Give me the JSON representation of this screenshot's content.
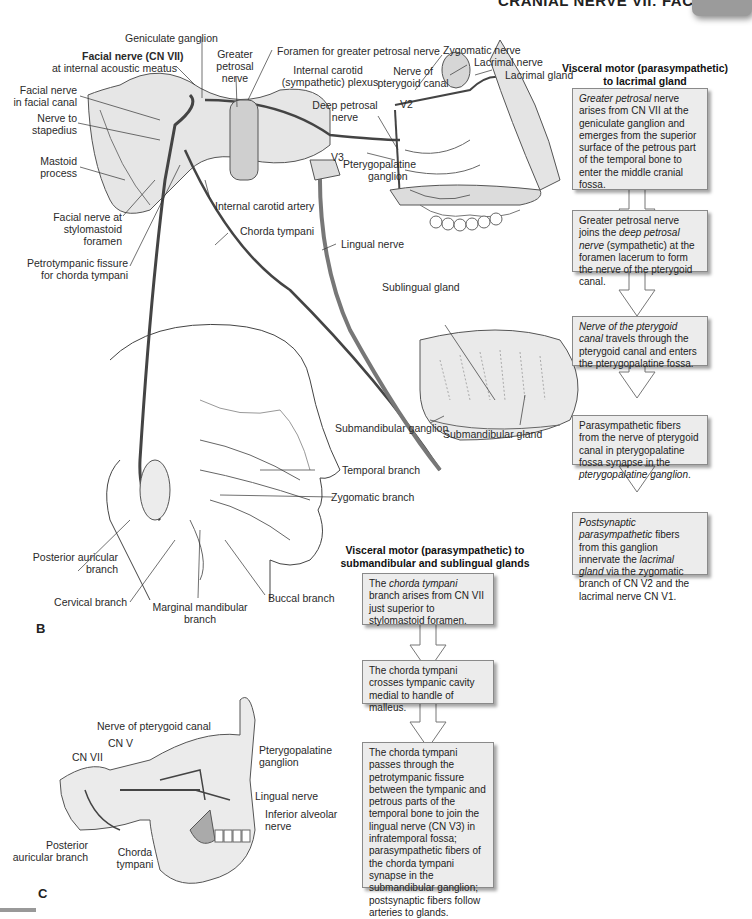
{
  "header": {
    "title": "CRANIAL NERVE VII: FACIAL",
    "page_tab": ""
  },
  "figure_b": {
    "letter": "B",
    "labels": {
      "geniculate_ganglion": "Geniculate ganglion",
      "facial_nerve_bold": "Facial nerve (CN VII)",
      "facial_nerve_sub": "at internal acoustic meatus",
      "greater_petrosal_1": "Greater",
      "greater_petrosal_2": "petrosal",
      "greater_petrosal_3": "nerve",
      "foramen_greater_petrosal": "Foramen for greater petrosal nerve",
      "internal_carotid_plexus_1": "Internal carotid",
      "internal_carotid_plexus_2": "(sympathetic) plexus",
      "nerve_pterygoid_1": "Nerve of",
      "nerve_pterygoid_2": "pterygoid canal",
      "deep_petrosal_1": "Deep petrosal",
      "deep_petrosal_2": "nerve",
      "zygomatic_nerve": "Zygomatic nerve",
      "lacrimal_nerve": "Lacrimal nerve",
      "lacrimal_gland": "Lacrimal gland",
      "v2": "V2",
      "v3": "V3",
      "facial_canal_1": "Facial nerve",
      "facial_canal_2": "in facial canal",
      "stapedius_1": "Nerve to",
      "stapedius_2": "stapedius",
      "mastoid_1": "Mastoid",
      "mastoid_2": "process",
      "pterygopalatine_1": "Pterygopalatine",
      "pterygopalatine_2": "ganglion",
      "internal_carotid_artery": "Internal carotid artery",
      "stylomastoid_1": "Facial nerve at",
      "stylomastoid_2": "stylomastoid",
      "stylomastoid_3": "foramen",
      "chorda_tympani": "Chorda tympani",
      "lingual_nerve": "Lingual nerve",
      "petrotympanic_1": "Petrotympanic fissure",
      "petrotympanic_2": "for chorda tympani",
      "sublingual_gland": "Sublingual gland",
      "submandibular_ganglion": "Submandibular ganglion",
      "submandibular_gland": "Submandibular gland",
      "temporal_branch": "Temporal branch",
      "zygomatic_branch": "Zygomatic branch",
      "posterior_auricular_1": "Posterior auricular",
      "posterior_auricular_2": "branch",
      "cervical_branch": "Cervical branch",
      "marginal_mandibular_1": "Marginal mandibular",
      "marginal_mandibular_2": "branch",
      "buccal_branch": "Buccal branch"
    }
  },
  "figure_c": {
    "letter": "C",
    "labels": {
      "nerve_pterygoid": "Nerve of pterygoid canal",
      "cn_v": "CN V",
      "cn_vii": "CN VII",
      "pterygopalatine_1": "Pterygopalatine",
      "pterygopalatine_2": "ganglion",
      "lingual_nerve": "Lingual nerve",
      "inferior_alveolar_1": "Inferior alveolar",
      "inferior_alveolar_2": "nerve",
      "posterior_auricular_1": "Posterior",
      "posterior_auricular_2": "auricular branch",
      "chorda_1": "Chorda",
      "chorda_2": "tympani"
    }
  },
  "flow_lacrimal": {
    "title_1": "Visceral motor (parasympathetic)",
    "title_2": "to lacrimal gland",
    "steps": [
      {
        "italic": "Greater petrosal",
        "text": " nerve arises from CN VII at the geniculate ganglion and emerges from the superior surface of the petrous part of the temporal bone to enter the middle cranial fossa."
      },
      {
        "pre": "Greater petrosal nerve joins the ",
        "italic": "deep petrosal nerve",
        "text": " (sympathetic) at the foramen lacerum to form the nerve of the pterygoid canal."
      },
      {
        "italic": "Nerve of the pterygoid canal",
        "text": " travels through the pterygoid canal and enters the pterygopalatine fossa."
      },
      {
        "pre": "Parasympathetic fibers from the nerve of pterygoid canal in pterygopalatine fossa synapse in the ",
        "italic": "pterygopalatine ganglion",
        "text": "."
      },
      {
        "italic": "Postsynaptic parasympathetic",
        "pre2": " fibers from this ganglion innervate the ",
        "italic2": "lacrimal gland",
        "text": " via the zygomatic branch of CN V2 and the lacrimal nerve CN V1."
      }
    ]
  },
  "flow_salivary": {
    "title_1": "Visceral motor (parasympathetic) to",
    "title_2": "submandibular and sublingual glands",
    "steps": [
      {
        "pre": "The ",
        "italic": "chorda tympani",
        "text": " branch arises from CN VII just superior to stylomastoid foramen."
      },
      {
        "text": "The chorda tympani crosses tympanic cavity medial to handle of malleus."
      },
      {
        "text": "The chorda tympani passes through the petrotympanic fissure between the tympanic and petrous parts of the temporal bone to join the lingual nerve (CN V3) in infratemporal fossa; parasympathetic fibers of the chorda tympani synapse in the submandibular ganglion; postsynaptic fibers follow arteries to glands."
      }
    ]
  },
  "colors": {
    "box_fill": "#ececec",
    "box_border": "#8a8a8a",
    "nerve": "#555555",
    "bone": "#d9d9d9",
    "tab": "#9b9b9b"
  }
}
